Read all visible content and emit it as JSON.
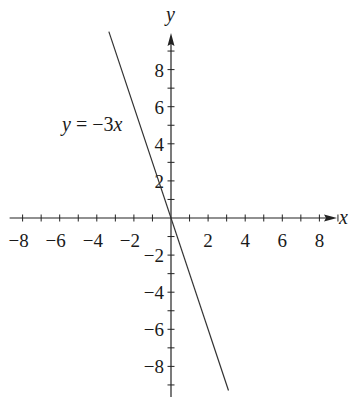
{
  "chart_data": {
    "type": "line",
    "title": "",
    "xlabel": "x",
    "ylabel": "y",
    "xlim": [
      -8.7,
      9
    ],
    "ylim": [
      -9.6,
      10
    ],
    "grid": false,
    "legend": null,
    "x_ticks": [
      -8,
      -6,
      -4,
      -2,
      2,
      4,
      6,
      8
    ],
    "y_ticks": [
      -8,
      -6,
      -4,
      -2,
      2,
      4,
      6,
      8
    ],
    "minor_tick_step": 1,
    "series": [
      {
        "name": "y = −3x",
        "equation": "y = -3x",
        "slope": -3,
        "intercept": 0,
        "x": [
          -3.35,
          3.1
        ],
        "y": [
          10.05,
          -9.3
        ],
        "color": "#333333"
      }
    ],
    "annotations": [
      {
        "text": "y = −3x",
        "x": -5.4,
        "y": 5.0
      }
    ]
  },
  "axes": {
    "x_label": "x",
    "y_label": "y",
    "color": "#222222"
  },
  "equation_label": {
    "var": "y",
    "eq": " = −3",
    "xvar": "x"
  }
}
